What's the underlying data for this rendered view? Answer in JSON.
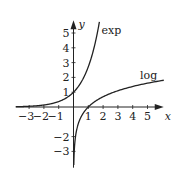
{
  "chart_data": {
    "type": "line",
    "title": "",
    "xlabel": "x",
    "ylabel": "y",
    "xlim": [
      -3.9,
      6.1
    ],
    "ylim": [
      -4.1,
      5.8
    ],
    "grid": false,
    "legend": "inline curve labels",
    "x_ticks": [
      -3,
      -2,
      -1,
      1,
      2,
      3,
      4,
      5
    ],
    "x_tick_labels": [
      "−3",
      "−2",
      "−1",
      "1",
      "2",
      "3",
      "4",
      "5"
    ],
    "y_ticks": [
      -3,
      -2,
      1,
      2,
      3,
      4,
      5
    ],
    "y_tick_labels": [
      "−3",
      "−2",
      "1",
      "2",
      "3",
      "4",
      "5"
    ],
    "series": [
      {
        "name": "exp",
        "function": "e^x",
        "x": [
          -3.9,
          -3,
          -2,
          -1,
          0,
          1,
          1.5,
          1.75
        ],
        "y": [
          0.02,
          0.05,
          0.14,
          0.37,
          1,
          2.72,
          4.48,
          5.75
        ]
      },
      {
        "name": "log",
        "function": "ln(x)",
        "x": [
          0.02,
          0.05,
          0.1,
          0.5,
          1,
          2,
          3,
          4,
          5,
          6.1
        ],
        "y": [
          -3.91,
          -3.0,
          -2.3,
          -0.69,
          0,
          0.69,
          1.1,
          1.39,
          1.61,
          1.81
        ]
      }
    ],
    "annotations": [
      {
        "text": "exp",
        "near": [
          1.9,
          4.9
        ]
      },
      {
        "text": "log",
        "near": [
          4.5,
          1.9
        ]
      }
    ]
  }
}
